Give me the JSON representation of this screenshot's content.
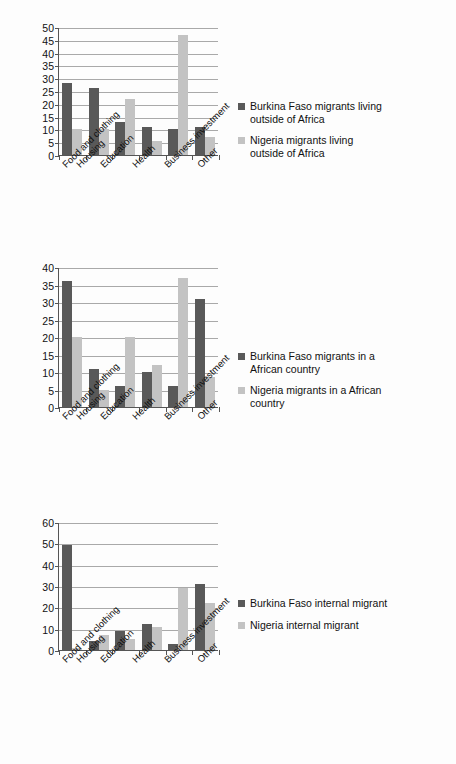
{
  "chart_data": [
    {
      "id": "chart-1",
      "type": "bar",
      "title": "",
      "xlabel": "",
      "ylabel": "",
      "ylim": [
        0,
        50
      ],
      "yticks": [
        0,
        5,
        10,
        15,
        20,
        25,
        30,
        35,
        40,
        45,
        50
      ],
      "grid": true,
      "legend_position": "right",
      "categories": [
        "Food and clothing",
        "Housing",
        "Education",
        "Health",
        "Business investment",
        "Other"
      ],
      "series": [
        {
          "name": "Burkina Faso migrants living outside of Africa",
          "color": "#595959",
          "values": [
            28,
            26,
            13,
            11,
            10,
            11
          ]
        },
        {
          "name": "Nigeria migrants living outside of Africa",
          "color": "#c3c3c3",
          "values": [
            10,
            10,
            22,
            5.5,
            47,
            7
          ]
        }
      ]
    },
    {
      "id": "chart-2",
      "type": "bar",
      "title": "",
      "xlabel": "",
      "ylabel": "",
      "ylim": [
        0,
        40
      ],
      "yticks": [
        0,
        5,
        10,
        15,
        20,
        25,
        30,
        35,
        40
      ],
      "grid": true,
      "legend_position": "right",
      "categories": [
        "Food and clothing",
        "Housing",
        "Education",
        "Health",
        "Business investment",
        "Other"
      ],
      "series": [
        {
          "name": "Burkina Faso migrants in a African country",
          "color": "#595959",
          "values": [
            36,
            11,
            6,
            10,
            6,
            31
          ]
        },
        {
          "name": "Nigeria migrants in a African country",
          "color": "#c3c3c3",
          "values": [
            20,
            5,
            20,
            12,
            37,
            8.5
          ]
        }
      ]
    },
    {
      "id": "chart-3",
      "type": "bar",
      "title": "",
      "xlabel": "",
      "ylabel": "",
      "ylim": [
        0,
        60
      ],
      "yticks": [
        0,
        10,
        20,
        30,
        40,
        50,
        60
      ],
      "grid": true,
      "legend_position": "right",
      "categories": [
        "Food and clothing",
        "Housing",
        "Education",
        "Health",
        "Business investment",
        "Other"
      ],
      "series": [
        {
          "name": "Burkina Faso internal migrant",
          "color": "#595959",
          "values": [
            49,
            4,
            9,
            12,
            3,
            31
          ]
        },
        {
          "name": "Nigeria internal migrant",
          "color": "#c3c3c3",
          "values": [
            1,
            7,
            5,
            11,
            29,
            22
          ]
        }
      ]
    }
  ],
  "charts": {
    "chart1": {
      "yticks": [
        "50",
        "45",
        "40",
        "35",
        "30",
        "25",
        "20",
        "15",
        "10",
        "5",
        "0"
      ],
      "categories": [
        "Food and clothing",
        "Housing",
        "Education",
        "Health",
        "Business investment",
        "Other"
      ],
      "legend": [
        "Burkina Faso migrants living outside of Africa",
        "Nigeria migrants living outside of Africa"
      ]
    },
    "chart2": {
      "yticks": [
        "40",
        "35",
        "30",
        "25",
        "20",
        "15",
        "10",
        "5",
        "0"
      ],
      "categories": [
        "Food and clothing",
        "Housing",
        "Education",
        "Health",
        "Business investment",
        "Other"
      ],
      "legend": [
        "Burkina Faso migrants in a African country",
        "Nigeria migrants in a African country"
      ]
    },
    "chart3": {
      "yticks": [
        "60",
        "50",
        "40",
        "30",
        "20",
        "10",
        "0"
      ],
      "categories": [
        "Food and clothing",
        "Housing",
        "Education",
        "Health",
        "Business investment",
        "Other"
      ],
      "legend": [
        "Burkina Faso internal migrant",
        "Nigeria internal migrant"
      ]
    }
  }
}
